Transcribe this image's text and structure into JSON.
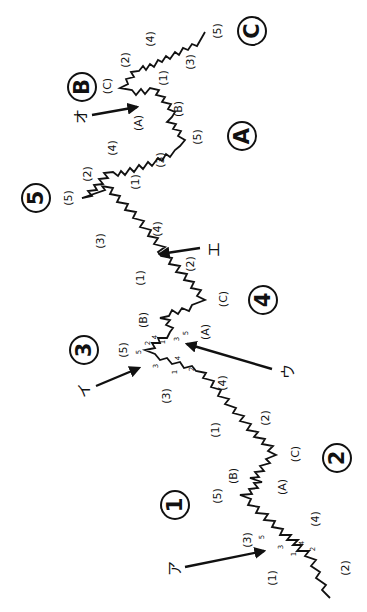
{
  "diagram": {
    "type": "elliott-wave",
    "orientation": "rotated-90-ccw",
    "stroke_color": "#111111",
    "background": "#ffffff",
    "main_waves": [
      {
        "label": "1",
        "x": 175,
        "y": 505
      },
      {
        "label": "2",
        "x": 337,
        "y": 458
      },
      {
        "label": "3",
        "x": 84,
        "y": 350
      },
      {
        "label": "4",
        "x": 263,
        "y": 300
      },
      {
        "label": "5",
        "x": 36,
        "y": 198
      },
      {
        "label": "A",
        "x": 242,
        "y": 136
      },
      {
        "label": "B",
        "x": 82,
        "y": 87
      },
      {
        "label": "C",
        "x": 252,
        "y": 31
      }
    ],
    "sub_waves": [
      {
        "label": "(1)",
        "x": 272,
        "y": 578
      },
      {
        "label": "(2)",
        "x": 345,
        "y": 568
      },
      {
        "label": "(3)",
        "x": 247,
        "y": 540
      },
      {
        "label": "(4)",
        "x": 315,
        "y": 519
      },
      {
        "label": "(5)",
        "x": 217,
        "y": 496
      },
      {
        "label": "(B)",
        "x": 233,
        "y": 476
      },
      {
        "label": "(A)",
        "x": 282,
        "y": 487
      },
      {
        "label": "(C)",
        "x": 295,
        "y": 454
      },
      {
        "label": "(1)",
        "x": 215,
        "y": 430
      },
      {
        "label": "(2)",
        "x": 265,
        "y": 418
      },
      {
        "label": "(3)",
        "x": 166,
        "y": 396
      },
      {
        "label": "(4)",
        "x": 222,
        "y": 383
      },
      {
        "label": "(5)",
        "x": 123,
        "y": 350
      },
      {
        "label": "(B)",
        "x": 143,
        "y": 320
      },
      {
        "label": "(A)",
        "x": 205,
        "y": 332
      },
      {
        "label": "(C)",
        "x": 223,
        "y": 299
      },
      {
        "label": "(1)",
        "x": 140,
        "y": 278
      },
      {
        "label": "(2)",
        "x": 190,
        "y": 264
      },
      {
        "label": "(3)",
        "x": 100,
        "y": 241
      },
      {
        "label": "(4)",
        "x": 157,
        "y": 229
      },
      {
        "label": "(5)",
        "x": 68,
        "y": 198
      },
      {
        "label": "(2)",
        "x": 87,
        "y": 174
      },
      {
        "label": "(1)",
        "x": 135,
        "y": 182
      },
      {
        "label": "(4)",
        "x": 112,
        "y": 148
      },
      {
        "label": "(3)",
        "x": 160,
        "y": 160
      },
      {
        "label": "(A)",
        "x": 138,
        "y": 123
      },
      {
        "label": "(B)",
        "x": 178,
        "y": 109
      },
      {
        "label": "(5)",
        "x": 197,
        "y": 137
      },
      {
        "label": "(C)",
        "x": 107,
        "y": 86
      },
      {
        "label": "(2)",
        "x": 125,
        "y": 60
      },
      {
        "label": "(1)",
        "x": 163,
        "y": 78
      },
      {
        "label": "(4)",
        "x": 150,
        "y": 39
      },
      {
        "label": "(3)",
        "x": 190,
        "y": 62
      },
      {
        "label": "(5)",
        "x": 217,
        "y": 31
      }
    ],
    "minor_waves": [
      {
        "label": "1",
        "x": 294,
        "y": 554
      },
      {
        "label": "2",
        "x": 313,
        "y": 549
      },
      {
        "label": "3",
        "x": 281,
        "y": 547
      },
      {
        "label": "4",
        "x": 302,
        "y": 543
      },
      {
        "label": "5",
        "x": 262,
        "y": 537
      },
      {
        "label": "1",
        "x": 175,
        "y": 372
      },
      {
        "label": "2",
        "x": 192,
        "y": 369
      },
      {
        "label": "3",
        "x": 156,
        "y": 366
      },
      {
        "label": "4",
        "x": 178,
        "y": 358
      },
      {
        "label": "5",
        "x": 139,
        "y": 352
      },
      {
        "label": "2",
        "x": 148,
        "y": 343
      },
      {
        "label": "4",
        "x": 155,
        "y": 337
      },
      {
        "label": "1",
        "x": 163,
        "y": 342
      },
      {
        "label": "3",
        "x": 177,
        "y": 339
      },
      {
        "label": "5",
        "x": 186,
        "y": 333
      }
    ],
    "callouts": [
      {
        "label": "ア",
        "text_x": 175,
        "text_y": 568,
        "x1": 185,
        "y1": 567,
        "x2": 266,
        "y2": 551
      },
      {
        "label": "イ",
        "text_x": 84,
        "text_y": 390,
        "x1": 96,
        "y1": 386,
        "x2": 140,
        "y2": 367
      },
      {
        "label": "ウ",
        "text_x": 288,
        "text_y": 371,
        "x1": 272,
        "y1": 369,
        "x2": 185,
        "y2": 344
      },
      {
        "label": "エ",
        "text_x": 214,
        "text_y": 249,
        "x1": 200,
        "y1": 248,
        "x2": 158,
        "y2": 254
      },
      {
        "label": "オ",
        "text_x": 81,
        "text_y": 116,
        "x1": 92,
        "y1": 115,
        "x2": 138,
        "y2": 106
      }
    ]
  }
}
